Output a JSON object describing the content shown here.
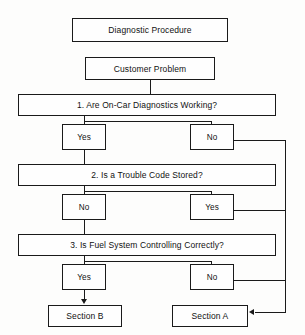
{
  "diagram": {
    "title_box": {
      "label": "Diagnostic Procedure"
    },
    "problem_box": {
      "label": "Customer Problem"
    },
    "steps": [
      {
        "label": "1. Are On-Car Diagnostics Working?",
        "left_branch": "Yes",
        "right_branch": "No"
      },
      {
        "label": "2. Is a Trouble Code Stored?",
        "left_branch": "No",
        "right_branch": "Yes"
      },
      {
        "label": "3. Is Fuel System Controlling Correctly?",
        "left_branch": "Yes",
        "right_branch": "No"
      }
    ],
    "outcomes": [
      {
        "label": "Section B"
      },
      {
        "label": "Section A"
      }
    ],
    "colors": {
      "line": "#1a1a1a",
      "box_fill": "#fefefe",
      "background": "#fdfdfc",
      "text": "#111111"
    }
  }
}
